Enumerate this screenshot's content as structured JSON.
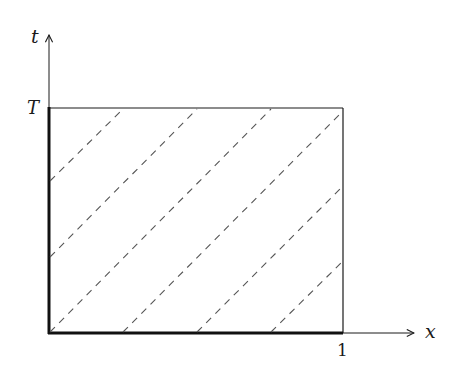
{
  "diagram": {
    "axes": {
      "x_label": "x",
      "y_label": "t"
    },
    "tick_labels": {
      "x_tick": "1",
      "y_tick": "T"
    },
    "domain": {
      "x_range": [
        0,
        1
      ],
      "t_range": [
        0,
        "T"
      ],
      "thick_boundaries": [
        "left edge x=0",
        "bottom edge t=0"
      ]
    },
    "characteristics": {
      "style": "dashed",
      "direction": "up-right",
      "count": 6
    },
    "colors": {
      "stroke": "#1a1a1a",
      "dash": "#555555",
      "background": "#ffffff"
    }
  }
}
